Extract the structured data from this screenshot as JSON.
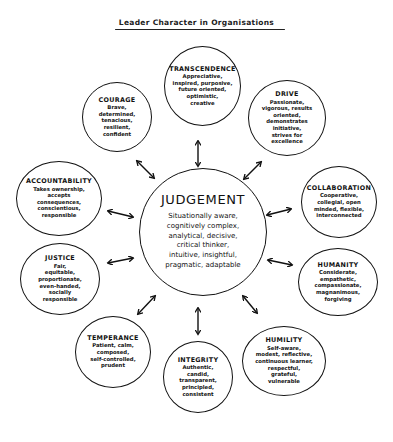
{
  "title": "Leader Character in Organisations",
  "center": {
    "label": "JUDGEMENT",
    "description": "Situationally aware,\ncognitively complex,\nanalytical, decisive,\ncritical thinker,\nintuitive, insightful,\npragmatic, adaptable"
  },
  "dimensions": [
    {
      "id": "transcendence",
      "label": "TRANSCENDENCE",
      "description": "Appreciative,\ninspired, purposive,\nfuture oriented,\noptimistic,\ncreative"
    },
    {
      "id": "drive",
      "label": "DRIVE",
      "description": "Passionate,\nvigorous, results\noriented,\ndemonstrates\ninitiative,\nstrives for\nexcellence"
    },
    {
      "id": "collaboration",
      "label": "COLLABORATION",
      "description": "Cooperative,\ncollegial, open\nminded, flexible,\ninterconnected"
    },
    {
      "id": "humanity",
      "label": "HUMANITY",
      "description": "Considerate,\nempathetic,\ncompassionate,\nmagnanimous,\nforgiving"
    },
    {
      "id": "humility",
      "label": "HUMILITY",
      "description": "Self-aware,\nmodest, reflective,\ncontinuous learner,\nrespectful,\ngrateful,\nvulnerable"
    },
    {
      "id": "integrity",
      "label": "INTEGRITY",
      "description": "Authentic,\ncandid,\ntransparent,\nprincipled,\nconsistent"
    },
    {
      "id": "temperance",
      "label": "TEMPERANCE",
      "description": "Patient, calm,\ncomposed,\nself-controlled,\nprudent"
    },
    {
      "id": "justice",
      "label": "JUSTICE",
      "description": "Fair,\nequitable,\nproportionate,\neven-handed,\nsocially\nresponsible"
    },
    {
      "id": "accountability",
      "label": "ACCOUNTABILITY",
      "description": "Takes ownership,\naccepts\nconsequences,\nconscientious,\nresponsible"
    },
    {
      "id": "courage",
      "label": "COURAGE",
      "description": "Brave,\ndetermined,\ntenacious,\nresilient,\nconfident"
    }
  ],
  "colors": {
    "stroke": "#111111",
    "background": "#ffffff"
  }
}
